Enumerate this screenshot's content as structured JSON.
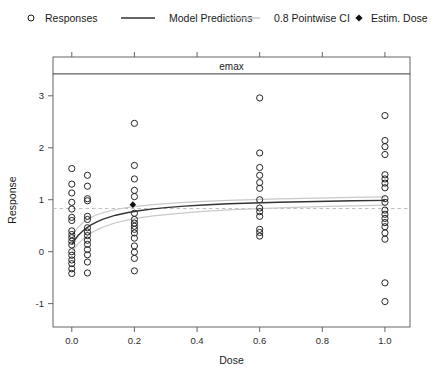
{
  "legend": {
    "items": [
      {
        "label": "Responses",
        "marker": "open-circle-icon",
        "color": "#1a1a1a"
      },
      {
        "label": "Model Predictions",
        "marker": "solid-line-icon",
        "color": "#333333"
      },
      {
        "label": "0.8 Pointwise CI",
        "marker": "light-line-icon",
        "color": "#c9c9c9"
      },
      {
        "label": "Estim. Dose",
        "marker": "filled-diamond-icon",
        "color": "#111111"
      }
    ]
  },
  "panel": {
    "strip_label": "emax",
    "frame_color": "#555555",
    "background": "#ffffff"
  },
  "chart_data": {
    "type": "scatter",
    "title": "emax",
    "xlabel": "Dose",
    "ylabel": "Response",
    "xlim": [
      -0.06,
      1.08
    ],
    "ylim": [
      -1.45,
      3.42
    ],
    "xticks": [
      0.0,
      0.2,
      0.4,
      0.6,
      0.8,
      1.0
    ],
    "xticklabels": [
      "0.0",
      "0.2",
      "0.4",
      "0.6",
      "0.8",
      "1.0"
    ],
    "yticks": [
      -1,
      0,
      1,
      2,
      3
    ],
    "yticklabels": [
      "-1",
      "0",
      "1",
      "2",
      "3"
    ],
    "grid": false,
    "legend_position": "top",
    "series": [
      {
        "name": "Responses",
        "type": "scatter",
        "marker": "open-circle",
        "points": [
          {
            "x": 0.0,
            "y": 1.6
          },
          {
            "x": 0.0,
            "y": 1.3
          },
          {
            "x": 0.0,
            "y": 1.13
          },
          {
            "x": 0.0,
            "y": 0.95
          },
          {
            "x": 0.0,
            "y": 0.82
          },
          {
            "x": 0.0,
            "y": 0.66
          },
          {
            "x": 0.0,
            "y": 0.6
          },
          {
            "x": 0.0,
            "y": 0.4
          },
          {
            "x": 0.0,
            "y": 0.33
          },
          {
            "x": 0.0,
            "y": 0.27
          },
          {
            "x": 0.0,
            "y": 0.2
          },
          {
            "x": 0.0,
            "y": 0.13
          },
          {
            "x": 0.0,
            "y": 0.0
          },
          {
            "x": 0.0,
            "y": -0.07
          },
          {
            "x": 0.0,
            "y": -0.16
          },
          {
            "x": 0.0,
            "y": -0.23
          },
          {
            "x": 0.0,
            "y": -0.33
          },
          {
            "x": 0.0,
            "y": -0.42
          },
          {
            "x": 0.05,
            "y": 1.47
          },
          {
            "x": 0.05,
            "y": 1.26
          },
          {
            "x": 0.05,
            "y": 1.02
          },
          {
            "x": 0.05,
            "y": 0.98
          },
          {
            "x": 0.05,
            "y": 0.68
          },
          {
            "x": 0.05,
            "y": 0.62
          },
          {
            "x": 0.05,
            "y": 0.46
          },
          {
            "x": 0.05,
            "y": 0.38
          },
          {
            "x": 0.05,
            "y": 0.31
          },
          {
            "x": 0.05,
            "y": 0.22
          },
          {
            "x": 0.05,
            "y": 0.14
          },
          {
            "x": 0.05,
            "y": 0.04
          },
          {
            "x": 0.05,
            "y": -0.06
          },
          {
            "x": 0.05,
            "y": -0.2
          },
          {
            "x": 0.05,
            "y": -0.41
          },
          {
            "x": 0.2,
            "y": 2.47
          },
          {
            "x": 0.2,
            "y": 1.66
          },
          {
            "x": 0.2,
            "y": 1.4
          },
          {
            "x": 0.2,
            "y": 1.18
          },
          {
            "x": 0.2,
            "y": 1.06
          },
          {
            "x": 0.2,
            "y": 0.74
          },
          {
            "x": 0.2,
            "y": 0.62
          },
          {
            "x": 0.2,
            "y": 0.55
          },
          {
            "x": 0.2,
            "y": 0.49
          },
          {
            "x": 0.2,
            "y": 0.43
          },
          {
            "x": 0.2,
            "y": 0.36
          },
          {
            "x": 0.2,
            "y": 0.26
          },
          {
            "x": 0.2,
            "y": 0.11
          },
          {
            "x": 0.2,
            "y": -0.01
          },
          {
            "x": 0.2,
            "y": -0.13
          },
          {
            "x": 0.2,
            "y": -0.37
          },
          {
            "x": 0.6,
            "y": 2.96
          },
          {
            "x": 0.6,
            "y": 1.9
          },
          {
            "x": 0.6,
            "y": 1.62
          },
          {
            "x": 0.6,
            "y": 1.47
          },
          {
            "x": 0.6,
            "y": 1.33
          },
          {
            "x": 0.6,
            "y": 1.22
          },
          {
            "x": 0.6,
            "y": 1.0
          },
          {
            "x": 0.6,
            "y": 0.84
          },
          {
            "x": 0.6,
            "y": 0.77
          },
          {
            "x": 0.6,
            "y": 0.68
          },
          {
            "x": 0.6,
            "y": 0.43
          },
          {
            "x": 0.6,
            "y": 0.37
          },
          {
            "x": 0.6,
            "y": 0.3
          },
          {
            "x": 1.0,
            "y": 2.62
          },
          {
            "x": 1.0,
            "y": 2.14
          },
          {
            "x": 1.0,
            "y": 2.02
          },
          {
            "x": 1.0,
            "y": 1.87
          },
          {
            "x": 1.0,
            "y": 1.48
          },
          {
            "x": 1.0,
            "y": 1.4
          },
          {
            "x": 1.0,
            "y": 1.32
          },
          {
            "x": 1.0,
            "y": 1.23
          },
          {
            "x": 1.0,
            "y": 1.02
          },
          {
            "x": 1.0,
            "y": 0.95
          },
          {
            "x": 1.0,
            "y": 0.8
          },
          {
            "x": 1.0,
            "y": 0.72
          },
          {
            "x": 1.0,
            "y": 0.64
          },
          {
            "x": 1.0,
            "y": 0.56
          },
          {
            "x": 1.0,
            "y": 0.48
          },
          {
            "x": 1.0,
            "y": 0.36
          },
          {
            "x": 1.0,
            "y": 0.24
          },
          {
            "x": 1.0,
            "y": -0.6
          },
          {
            "x": 1.0,
            "y": -0.96
          }
        ]
      },
      {
        "name": "Model Predictions",
        "type": "line",
        "color": "#333333",
        "x": [
          0.0,
          0.02,
          0.04,
          0.06,
          0.08,
          0.1,
          0.14,
          0.18,
          0.22,
          0.26,
          0.3,
          0.36,
          0.42,
          0.5,
          0.58,
          0.66,
          0.74,
          0.82,
          0.9,
          1.0
        ],
        "y": [
          0.145,
          0.31,
          0.425,
          0.51,
          0.575,
          0.627,
          0.702,
          0.755,
          0.793,
          0.823,
          0.847,
          0.877,
          0.899,
          0.921,
          0.938,
          0.951,
          0.962,
          0.971,
          0.979,
          0.988
        ]
      },
      {
        "name": "0.8 Pointwise CI upper",
        "type": "line",
        "color": "#c9c9c9",
        "x": [
          0.0,
          0.02,
          0.04,
          0.06,
          0.08,
          0.1,
          0.14,
          0.18,
          0.22,
          0.26,
          0.3,
          0.36,
          0.42,
          0.5,
          0.58,
          0.66,
          0.74,
          0.82,
          0.9,
          1.0
        ],
        "y": [
          0.3,
          0.47,
          0.58,
          0.655,
          0.71,
          0.752,
          0.812,
          0.853,
          0.883,
          0.906,
          0.925,
          0.949,
          0.967,
          0.987,
          1.002,
          1.015,
          1.026,
          1.036,
          1.045,
          1.055
        ]
      },
      {
        "name": "0.8 Pointwise CI lower",
        "type": "line",
        "color": "#c9c9c9",
        "x": [
          0.0,
          0.02,
          0.04,
          0.06,
          0.08,
          0.1,
          0.14,
          0.18,
          0.22,
          0.26,
          0.3,
          0.36,
          0.42,
          0.5,
          0.58,
          0.66,
          0.74,
          0.82,
          0.9,
          1.0
        ],
        "y": [
          -0.01,
          0.15,
          0.265,
          0.352,
          0.42,
          0.475,
          0.556,
          0.613,
          0.655,
          0.688,
          0.714,
          0.748,
          0.774,
          0.803,
          0.824,
          0.842,
          0.857,
          0.87,
          0.882,
          0.896
        ]
      }
    ],
    "reference_line": {
      "name": "target-response",
      "orientation": "horizontal",
      "y": 0.83,
      "style": "dashed",
      "color": "#bdbdbd"
    },
    "estimated_dose": {
      "name": "Estim. Dose",
      "marker": "filled-diamond",
      "color": "#111111",
      "points": [
        {
          "x": 0.195,
          "y": 0.905
        }
      ]
    }
  }
}
